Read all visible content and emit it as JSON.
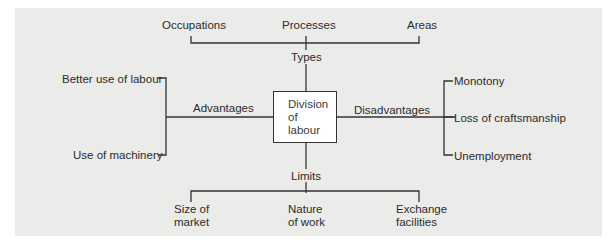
{
  "diagram": {
    "center": {
      "line1": "Division",
      "line2": "of",
      "line3": "labour"
    },
    "types": {
      "label": "Types",
      "items": [
        "Occupations",
        "Processes",
        "Areas"
      ]
    },
    "advantages": {
      "label": "Advantages",
      "items": [
        "Better use of labour",
        "Use of machinery"
      ]
    },
    "disadvantages": {
      "label": "Disadvantages",
      "items": [
        "Monotony",
        "Loss of craftsmanship",
        "Unemployment"
      ]
    },
    "limits": {
      "label": "Limits",
      "items": [
        {
          "line1": "Size of",
          "line2": "market"
        },
        {
          "line1": "Nature",
          "line2": "of work"
        },
        {
          "line1": "Exchange",
          "line2": "facilities"
        }
      ]
    }
  },
  "colors": {
    "panel": "#ebebea",
    "line": "#333333",
    "box": "#ffffff"
  }
}
